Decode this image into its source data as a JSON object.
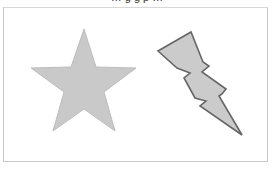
{
  "caption": "… g   g   p …",
  "shapes": [
    {
      "name": "star",
      "fill": "#c9c9c9",
      "stroke": "#bdbdbd",
      "points": "84,29 96,67 136,68 104,92 115,131 84,109 53,131 64,92 31,68 71,67"
    },
    {
      "name": "lightning-bolt",
      "fill": "#cbcbcb",
      "stroke": "#666666",
      "points": "158,51 191,32 203,62 209,66 202,72 226,89 222,94 219,96 242,135 200,106 206,101 195,98 184,78 190,73 177,68"
    }
  ]
}
